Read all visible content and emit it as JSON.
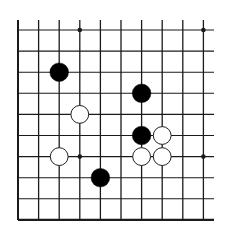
{
  "board": {
    "type": "go-board-fragment",
    "columns": 10,
    "rows": 10,
    "open_edges": [
      "top",
      "right"
    ],
    "closed_edges": [
      "left",
      "bottom"
    ],
    "colors": {
      "background": "#ffffff",
      "line": "#1a1a1a",
      "black_stone": "#000000",
      "white_stone": "#ffffff",
      "white_stone_outline": "#222222"
    },
    "star_points": [
      {
        "col": 3,
        "row": 0
      },
      {
        "col": 9,
        "row": 0
      },
      {
        "col": 3,
        "row": 6
      },
      {
        "col": 9,
        "row": 6
      }
    ],
    "stones": [
      {
        "color": "black",
        "col": 2,
        "row": 2
      },
      {
        "color": "black",
        "col": 6,
        "row": 3
      },
      {
        "color": "white",
        "col": 3,
        "row": 4
      },
      {
        "color": "black",
        "col": 6,
        "row": 5
      },
      {
        "color": "white",
        "col": 7,
        "row": 5
      },
      {
        "color": "white",
        "col": 2,
        "row": 6
      },
      {
        "color": "white",
        "col": 6,
        "row": 6
      },
      {
        "color": "white",
        "col": 7,
        "row": 6
      },
      {
        "color": "black",
        "col": 4,
        "row": 7
      }
    ]
  }
}
